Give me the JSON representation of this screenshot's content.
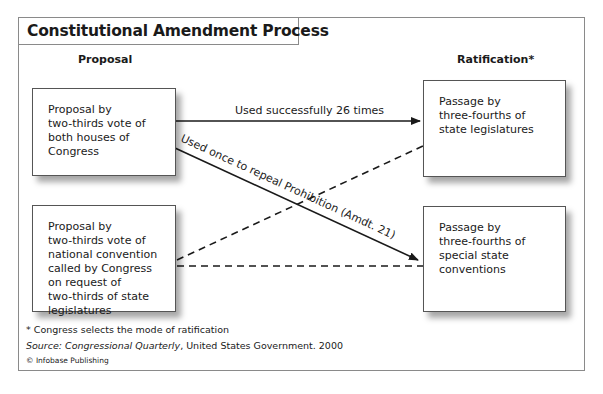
{
  "title": "Constitutional Amendment Process",
  "columns": {
    "proposal": "Proposal",
    "ratification": "Ratification*"
  },
  "boxes": {
    "proposal_congress": "Proposal by\ntwo-thirds vote of\nboth houses of\nCongress",
    "proposal_convention": "Proposal by\ntwo-thirds vote of\nnational convention\ncalled by Congress\non request of\ntwo-thirds of state\nlegislatures",
    "ratification_legislatures": "Passage by\nthree-fourths of\nstate legislatures",
    "ratification_conventions": "Passage by\nthree-fourths of\nspecial state\nconventions"
  },
  "arrows": {
    "congress_to_legislatures": {
      "label": "Used successfully 26 times",
      "style": "solid"
    },
    "congress_to_conventions": {
      "label": "Used once to repeal Prohibition (Amdt. 21)",
      "style": "solid"
    },
    "convention_to_legislatures": {
      "label": "",
      "style": "dashed"
    },
    "convention_to_conventions": {
      "label": "",
      "style": "dashed"
    }
  },
  "footnotes": {
    "note": "* Congress selects the mode of ratification",
    "source_prefix": "Source: ",
    "source_title": "Congressional Quarterly",
    "source_rest": ", United States Government. 2000",
    "copyright": "© Infobase Publishing"
  },
  "colors": {
    "line": "#1a1a1a",
    "border": "#8a8a8a",
    "background": "#ffffff"
  }
}
